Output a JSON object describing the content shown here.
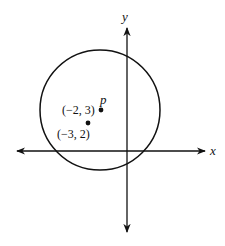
{
  "diagram": {
    "type": "coordinate-plane-circle",
    "axes": {
      "x_label": "x",
      "y_label": "y"
    },
    "circle": {
      "center_label": "p",
      "center_point_label": "(−2, 3)"
    },
    "points": [
      {
        "name": "p",
        "label": "(−2, 3)",
        "coords": [
          -2,
          3
        ]
      },
      {
        "name": "point",
        "label": "(−3, 2)",
        "coords": [
          -3,
          2
        ]
      }
    ],
    "colors": {
      "stroke": "#111111",
      "background": "#ffffff"
    }
  }
}
